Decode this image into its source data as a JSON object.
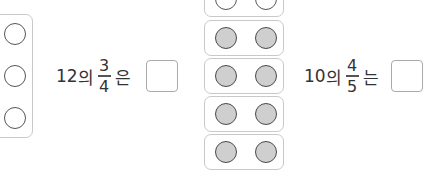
{
  "problems": [
    {
      "whole": "12",
      "particle_of": "의",
      "numerator": "3",
      "denominator": "4",
      "particle_topic": "은",
      "answer": ""
    },
    {
      "whole": "10",
      "particle_of": "의",
      "numerator": "4",
      "denominator": "5",
      "particle_topic": "는",
      "answer": ""
    }
  ],
  "left_model": {
    "groups": 1,
    "circles": 3,
    "filled": 0
  },
  "right_model": {
    "groups": 5,
    "circles_per_group": 2,
    "filled_groups": 4,
    "empty_groups": 1
  },
  "colors": {
    "fill": "#cfcfcf",
    "stroke": "#555555",
    "border": "#c9c9c9"
  }
}
